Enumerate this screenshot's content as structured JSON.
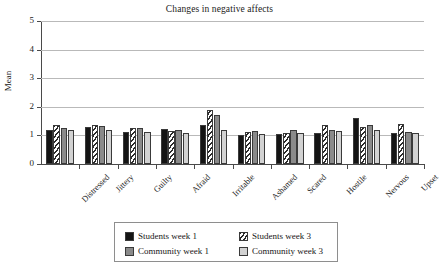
{
  "chart_data": {
    "type": "bar",
    "title": "Changes in negative affects",
    "xlabel": "",
    "ylabel": "Mean",
    "ylim": [
      0,
      5
    ],
    "yticks": [
      0,
      1,
      2,
      3,
      4,
      5
    ],
    "ytick_labels": [
      "0",
      "1",
      "2",
      "3",
      "4",
      "5"
    ],
    "grid": true,
    "legend_position": "bottom",
    "categories": [
      "Distressed",
      "Jittery",
      "Guilty",
      "Afraid",
      "Irritable",
      "Ashamed",
      "Scared",
      "Hostile",
      "Nervous",
      "Upset"
    ],
    "series": [
      {
        "name": "Students week 1",
        "fill": "solid-black",
        "color": "#141414",
        "values": [
          1.18,
          1.28,
          1.12,
          1.22,
          1.38,
          1.02,
          1.05,
          1.08,
          1.6,
          1.1
        ]
      },
      {
        "name": "Students week 3",
        "fill": "diagonal-hatch",
        "color": "#ffffff",
        "values": [
          1.35,
          1.38,
          1.25,
          1.15,
          1.9,
          1.12,
          1.08,
          1.35,
          1.28,
          1.4
        ]
      },
      {
        "name": "Community week 1",
        "fill": "dark-gray",
        "color": "#8a8a8a",
        "values": [
          1.25,
          1.32,
          1.25,
          1.18,
          1.7,
          1.15,
          1.18,
          1.18,
          1.35,
          1.12
        ]
      },
      {
        "name": "Community week 3",
        "fill": "light-gray",
        "color": "#d2d2d2",
        "values": [
          1.18,
          1.2,
          1.12,
          1.1,
          1.2,
          1.05,
          1.08,
          1.15,
          1.2,
          1.08
        ]
      }
    ]
  },
  "legend": {
    "entries": [
      "Students week 1",
      "Students week 3",
      "Community week 1",
      "Community week 3"
    ]
  }
}
